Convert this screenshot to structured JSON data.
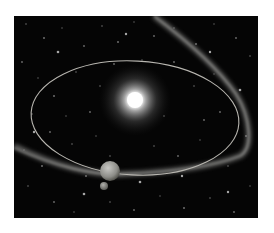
{
  "scene": {
    "description": "Illustration of a bright star with an elliptical orbit, a planet with a small moon, and a diffuse debris/comet stream against a starfield",
    "colors": {
      "background": "#050505",
      "star_core": "#ffffff",
      "orbit_line": "#b8b6b0",
      "debris_stream": "#8a8a88",
      "planet": "#9a9a96",
      "page_background": "#ffffff"
    }
  }
}
